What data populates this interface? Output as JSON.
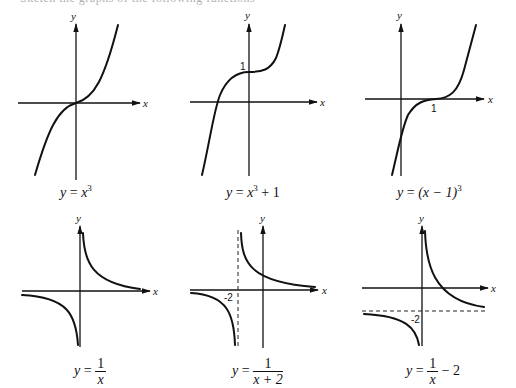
{
  "top_text": "Sketch the graphs of the following functions",
  "axis_labels": {
    "x": "x",
    "y": "y"
  },
  "graphs": [
    {
      "id": "cube",
      "caption": {
        "lhs": "y",
        "eq": "=",
        "rhs": "x",
        "exp": "3"
      }
    },
    {
      "id": "cube-plus-1",
      "caption": {
        "lhs": "y",
        "eq": "=",
        "rhs": "x",
        "exp": "3",
        "tail": " + 1"
      },
      "ticks": {
        "y_intercept": "1"
      }
    },
    {
      "id": "shifted-cube",
      "caption": {
        "lhs": "y",
        "eq": "=",
        "rhs": "(x − 1)",
        "exp": "3"
      },
      "ticks": {
        "x_intercept": "1"
      }
    },
    {
      "id": "reciprocal",
      "caption": {
        "lhs": "y",
        "eq": "=",
        "num": "1",
        "den": "x"
      }
    },
    {
      "id": "reciprocal-shift-left",
      "caption": {
        "lhs": "y",
        "eq": "=",
        "num": "1",
        "den": "x + 2"
      },
      "ticks": {
        "vertical_asymptote": "-2"
      }
    },
    {
      "id": "reciprocal-shift-down",
      "caption": {
        "lhs": "y",
        "eq": "=",
        "num": "1",
        "den": "x",
        "tail": " − 2"
      },
      "ticks": {
        "horizontal_asymptote": "-2"
      }
    }
  ]
}
